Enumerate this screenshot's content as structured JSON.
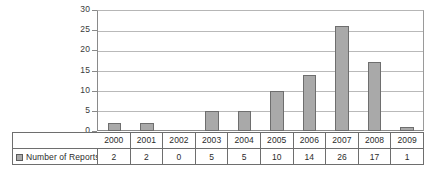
{
  "chart_data": {
    "type": "bar",
    "title": "",
    "subtitle": "",
    "xlabel": "",
    "ylabel": "",
    "categories": [
      "2000",
      "2001",
      "2002",
      "2003",
      "2004",
      "2005",
      "2006",
      "2007",
      "2008",
      "2009"
    ],
    "values": [
      2,
      2,
      0,
      5,
      5,
      10,
      14,
      26,
      17,
      1
    ],
    "series": [
      {
        "name": "Number of Reports",
        "values": [
          2,
          2,
          0,
          5,
          5,
          10,
          14,
          26,
          17,
          1
        ]
      }
    ],
    "ylim": [
      0,
      30
    ],
    "y_ticks": [
      0,
      5,
      10,
      15,
      20,
      25,
      30
    ],
    "y_tick_labels": [
      "0",
      "5",
      "10",
      "15",
      "20",
      "25",
      "30"
    ],
    "grid": true,
    "legend_position": "data-table-left",
    "bar_color": "#a9a9a9",
    "bar_border_color": "#6e6e6e",
    "gridline_color": "#b9b9b9",
    "axis_color": "#8a8a8a",
    "background_color": "#ffffff"
  },
  "legend": {
    "label": "Number of Reports",
    "swatch_name": "series-swatch"
  },
  "table": {
    "year_row": [
      "2000",
      "2001",
      "2002",
      "2003",
      "2004",
      "2005",
      "2006",
      "2007",
      "2008",
      "2009"
    ],
    "value_row": [
      "2",
      "2",
      "0",
      "5",
      "5",
      "10",
      "14",
      "26",
      "17",
      "1"
    ]
  }
}
